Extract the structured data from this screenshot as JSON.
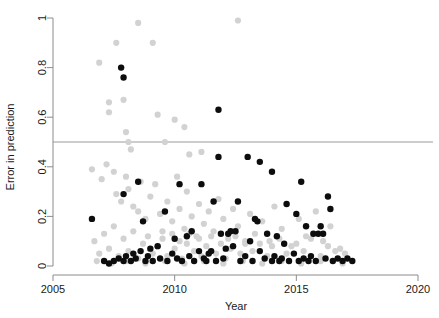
{
  "chart_data": {
    "type": "scatter",
    "title": "",
    "xlabel": "Year",
    "ylabel": "Error in prediction",
    "xlim": [
      2005,
      2020
    ],
    "ylim": [
      0,
      1
    ],
    "xticks": [
      2005,
      2010,
      2015,
      2020
    ],
    "xtick_labels": [
      "2005",
      "2010",
      "2015",
      "2020"
    ],
    "yticks": [
      0,
      0.2,
      0.4,
      0.6,
      0.8,
      1
    ],
    "ytick_labels": [
      "0",
      "0.2",
      "0.4",
      "0.6",
      "0.8",
      "1"
    ],
    "grid": false,
    "legend": "none",
    "annotations": [
      {
        "type": "hline",
        "y": 0.5,
        "color": "#9a9a9a",
        "label": ""
      }
    ],
    "colors": {
      "primary": "#0d0d0d",
      "secondary": "#d2d2d2",
      "axis": "#8c8c8c",
      "reference_line": "#9a9a9a",
      "background": "#ffffff"
    },
    "series": [
      {
        "name": "secondary",
        "color": "#d2d2d2",
        "marker": "circle",
        "marker_size": 3.1,
        "points": [
          [
            2006.9,
            0.82
          ],
          [
            2007.3,
            0.66
          ],
          [
            2007.3,
            0.62
          ],
          [
            2007.6,
            0.9
          ],
          [
            2007.8,
            0.8
          ],
          [
            2007.9,
            0.67
          ],
          [
            2008.0,
            0.54
          ],
          [
            2008.1,
            0.5
          ],
          [
            2008.2,
            0.47
          ],
          [
            2008.5,
            0.98
          ],
          [
            2009.1,
            0.9
          ],
          [
            2009.3,
            0.61
          ],
          [
            2009.6,
            0.5
          ],
          [
            2010.0,
            0.59
          ],
          [
            2010.4,
            0.56
          ],
          [
            2010.6,
            0.45
          ],
          [
            2011.1,
            0.46
          ],
          [
            2012.6,
            0.99
          ],
          [
            2006.6,
            0.39
          ],
          [
            2007.0,
            0.35
          ],
          [
            2007.2,
            0.41
          ],
          [
            2007.5,
            0.38
          ],
          [
            2007.6,
            0.29
          ],
          [
            2007.8,
            0.26
          ],
          [
            2008.0,
            0.36
          ],
          [
            2008.1,
            0.31
          ],
          [
            2008.3,
            0.24
          ],
          [
            2008.5,
            0.22
          ],
          [
            2008.6,
            0.34
          ],
          [
            2008.8,
            0.19
          ],
          [
            2009.0,
            0.28
          ],
          [
            2009.2,
            0.33
          ],
          [
            2009.4,
            0.21
          ],
          [
            2009.5,
            0.14
          ],
          [
            2009.7,
            0.26
          ],
          [
            2009.9,
            0.18
          ],
          [
            2010.1,
            0.36
          ],
          [
            2010.2,
            0.23
          ],
          [
            2010.4,
            0.15
          ],
          [
            2010.5,
            0.3
          ],
          [
            2010.7,
            0.2
          ],
          [
            2010.9,
            0.12
          ],
          [
            2011.0,
            0.25
          ],
          [
            2011.2,
            0.17
          ],
          [
            2011.4,
            0.22
          ],
          [
            2011.6,
            0.14
          ],
          [
            2011.8,
            0.27
          ],
          [
            2012.0,
            0.19
          ],
          [
            2012.2,
            0.11
          ],
          [
            2012.4,
            0.23
          ],
          [
            2012.6,
            0.16
          ],
          [
            2012.9,
            0.09
          ],
          [
            2013.1,
            0.21
          ],
          [
            2013.3,
            0.13
          ],
          [
            2013.6,
            0.18
          ],
          [
            2013.9,
            0.1
          ],
          [
            2014.1,
            0.24
          ],
          [
            2014.4,
            0.15
          ],
          [
            2014.8,
            0.08
          ],
          [
            2015.1,
            0.19
          ],
          [
            2015.4,
            0.12
          ],
          [
            2015.8,
            0.22
          ],
          [
            2016.1,
            0.1
          ],
          [
            2016.4,
            0.16
          ],
          [
            2016.8,
            0.07
          ],
          [
            2006.7,
            0.1
          ],
          [
            2006.9,
            0.05
          ],
          [
            2007.1,
            0.13
          ],
          [
            2007.3,
            0.07
          ],
          [
            2007.5,
            0.16
          ],
          [
            2007.7,
            0.04
          ],
          [
            2007.9,
            0.11
          ],
          [
            2008.1,
            0.06
          ],
          [
            2008.3,
            0.14
          ],
          [
            2008.5,
            0.03
          ],
          [
            2008.7,
            0.09
          ],
          [
            2008.9,
            0.12
          ],
          [
            2009.1,
            0.05
          ],
          [
            2009.3,
            0.08
          ],
          [
            2009.5,
            0.11
          ],
          [
            2009.7,
            0.04
          ],
          [
            2009.9,
            0.13
          ],
          [
            2010.0,
            0.07
          ],
          [
            2010.2,
            0.1
          ],
          [
            2010.3,
            0.03
          ],
          [
            2010.5,
            0.09
          ],
          [
            2010.6,
            0.13
          ],
          [
            2010.8,
            0.06
          ],
          [
            2011.0,
            0.11
          ],
          [
            2011.1,
            0.04
          ],
          [
            2011.3,
            0.08
          ],
          [
            2011.5,
            0.12
          ],
          [
            2011.7,
            0.05
          ],
          [
            2011.9,
            0.09
          ],
          [
            2012.1,
            0.03
          ],
          [
            2012.3,
            0.07
          ],
          [
            2012.5,
            0.12
          ],
          [
            2012.7,
            0.05
          ],
          [
            2012.9,
            0.1
          ],
          [
            2013.2,
            0.06
          ],
          [
            2013.5,
            0.09
          ],
          [
            2013.8,
            0.04
          ],
          [
            2014.0,
            0.08
          ],
          [
            2014.3,
            0.11
          ],
          [
            2014.6,
            0.05
          ],
          [
            2015.0,
            0.09
          ],
          [
            2015.3,
            0.06
          ],
          [
            2015.6,
            0.11
          ],
          [
            2016.0,
            0.04
          ],
          [
            2016.3,
            0.08
          ],
          [
            2016.6,
            0.06
          ],
          [
            2017.0,
            0.05
          ],
          [
            2006.8,
            0.02
          ],
          [
            2007.4,
            0.01
          ],
          [
            2008.0,
            0.02
          ],
          [
            2008.8,
            0.01
          ],
          [
            2009.6,
            0.02
          ],
          [
            2010.4,
            0.01
          ],
          [
            2011.2,
            0.02
          ],
          [
            2012.0,
            0.01
          ],
          [
            2012.8,
            0.02
          ],
          [
            2013.6,
            0.01
          ],
          [
            2014.4,
            0.02
          ],
          [
            2015.2,
            0.01
          ],
          [
            2016.0,
            0.02
          ],
          [
            2016.9,
            0.01
          ]
        ]
      },
      {
        "name": "primary",
        "color": "#0d0d0d",
        "marker": "circle",
        "marker_size": 3.2,
        "points": [
          [
            2007.8,
            0.8
          ],
          [
            2007.9,
            0.76
          ],
          [
            2011.8,
            0.63
          ],
          [
            2006.6,
            0.19
          ],
          [
            2007.9,
            0.29
          ],
          [
            2008.5,
            0.34
          ],
          [
            2008.7,
            0.18
          ],
          [
            2010.2,
            0.33
          ],
          [
            2011.1,
            0.33
          ],
          [
            2011.8,
            0.44
          ],
          [
            2013.0,
            0.44
          ],
          [
            2013.5,
            0.42
          ],
          [
            2014.0,
            0.38
          ],
          [
            2012.6,
            0.26
          ],
          [
            2015.2,
            0.34
          ],
          [
            2009.6,
            0.22
          ],
          [
            2010.7,
            0.14
          ],
          [
            2011.6,
            0.26
          ],
          [
            2012.3,
            0.14
          ],
          [
            2012.5,
            0.14
          ],
          [
            2013.3,
            0.19
          ],
          [
            2013.4,
            0.18
          ],
          [
            2014.6,
            0.25
          ],
          [
            2015.0,
            0.21
          ],
          [
            2015.4,
            0.16
          ],
          [
            2016.0,
            0.16
          ],
          [
            2016.3,
            0.28
          ],
          [
            2016.4,
            0.23
          ],
          [
            2009.0,
            0.07
          ],
          [
            2009.3,
            0.08
          ],
          [
            2010.0,
            0.11
          ],
          [
            2010.5,
            0.12
          ],
          [
            2011.5,
            0.06
          ],
          [
            2011.9,
            0.13
          ],
          [
            2012.2,
            0.13
          ],
          [
            2012.4,
            0.08
          ],
          [
            2013.1,
            0.1
          ],
          [
            2013.8,
            0.13
          ],
          [
            2014.2,
            0.12
          ],
          [
            2014.5,
            0.09
          ],
          [
            2015.7,
            0.13
          ],
          [
            2015.9,
            0.13
          ],
          [
            2016.1,
            0.13
          ],
          [
            2007.1,
            0.02
          ],
          [
            2007.3,
            0.01
          ],
          [
            2007.5,
            0.02
          ],
          [
            2007.7,
            0.03
          ],
          [
            2007.9,
            0.02
          ],
          [
            2008.0,
            0.04
          ],
          [
            2008.2,
            0.02
          ],
          [
            2008.3,
            0.05
          ],
          [
            2008.4,
            0.03
          ],
          [
            2008.6,
            0.06
          ],
          [
            2008.8,
            0.02
          ],
          [
            2008.9,
            0.04
          ],
          [
            2009.1,
            0.02
          ],
          [
            2009.4,
            0.03
          ],
          [
            2009.7,
            0.02
          ],
          [
            2009.9,
            0.05
          ],
          [
            2010.1,
            0.03
          ],
          [
            2010.3,
            0.02
          ],
          [
            2010.6,
            0.04
          ],
          [
            2010.8,
            0.02
          ],
          [
            2011.0,
            0.06
          ],
          [
            2011.2,
            0.03
          ],
          [
            2011.3,
            0.02
          ],
          [
            2011.4,
            0.05
          ],
          [
            2011.7,
            0.02
          ],
          [
            2012.0,
            0.03
          ],
          [
            2012.1,
            0.07
          ],
          [
            2012.7,
            0.02
          ],
          [
            2012.9,
            0.04
          ],
          [
            2013.2,
            0.02
          ],
          [
            2013.5,
            0.06
          ],
          [
            2013.7,
            0.03
          ],
          [
            2014.0,
            0.02
          ],
          [
            2014.1,
            0.04
          ],
          [
            2014.3,
            0.02
          ],
          [
            2014.4,
            0.03
          ],
          [
            2014.7,
            0.02
          ],
          [
            2014.9,
            0.05
          ],
          [
            2015.1,
            0.02
          ],
          [
            2015.3,
            0.03
          ],
          [
            2015.5,
            0.02
          ],
          [
            2015.6,
            0.04
          ],
          [
            2015.8,
            0.02
          ],
          [
            2016.2,
            0.03
          ],
          [
            2016.5,
            0.02
          ],
          [
            2016.7,
            0.03
          ],
          [
            2016.9,
            0.02
          ],
          [
            2017.1,
            0.03
          ],
          [
            2017.3,
            0.02
          ]
        ]
      }
    ]
  }
}
